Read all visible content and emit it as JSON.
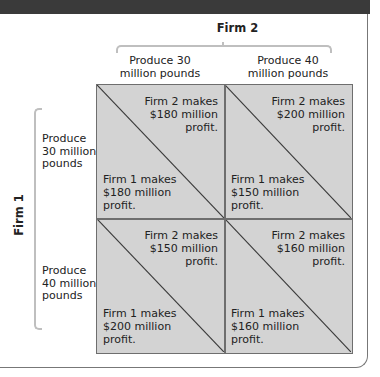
{
  "header": {
    "firm2_label": "Firm 2",
    "firm1_label": "Firm 1"
  },
  "columns": [
    {
      "label": "Produce 30 million pounds",
      "line1": "Produce 30",
      "line2": "million pounds"
    },
    {
      "label": "Produce 40 million pounds",
      "line1": "Produce 40",
      "line2": "million pounds"
    }
  ],
  "rows": [
    {
      "line1": "Produce",
      "line2": "30 million",
      "line3": "pounds"
    },
    {
      "line1": "Produce",
      "line2": "40 million",
      "line3": "pounds"
    }
  ],
  "cells": [
    {
      "firm2": {
        "l1": "Firm 2 makes",
        "l2": "$180 million",
        "l3": "profit."
      },
      "firm1": {
        "l1": "Firm 1 makes",
        "l2": "$180 million",
        "l3": "profit."
      }
    },
    {
      "firm2": {
        "l1": "Firm 2 makes",
        "l2": "$200 million",
        "l3": "profit."
      },
      "firm1": {
        "l1": "Firm 1 makes",
        "l2": "$150 million",
        "l3": "profit."
      }
    },
    {
      "firm2": {
        "l1": "Firm 2 makes",
        "l2": "$150 million",
        "l3": "profit."
      },
      "firm1": {
        "l1": "Firm 1 makes",
        "l2": "$200 million",
        "l3": "profit."
      }
    },
    {
      "firm2": {
        "l1": "Firm 2 makes",
        "l2": "$160 million",
        "l3": "profit."
      },
      "firm1": {
        "l1": "Firm 1 makes",
        "l2": "$160 million",
        "l3": "profit."
      }
    }
  ],
  "colors": {
    "cell_fill": "#d3d3d3",
    "grid_line": "#6e6e6e",
    "brace": "#bfbfbf",
    "top_bar": "#3a3a3a"
  }
}
